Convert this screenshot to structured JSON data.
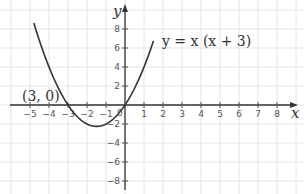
{
  "chart_data": {
    "type": "line",
    "title": "",
    "xlabel": "x",
    "ylabel": "y",
    "xlim": [
      -6.5,
      9
    ],
    "ylim": [
      -9,
      11
    ],
    "x_ticks": [
      -5,
      -4,
      -3,
      -2,
      -1,
      1,
      2,
      3,
      4,
      5,
      6,
      7,
      8
    ],
    "x_tick_labels": [
      "−5",
      "−4",
      "−3",
      "−2",
      "−1",
      "1",
      "2",
      "3",
      "4",
      "5",
      "6",
      "7",
      "8"
    ],
    "y_ticks": [
      8,
      6,
      4,
      2,
      -2,
      -4,
      -6,
      -8
    ],
    "y_tick_labels": [
      "8",
      "6",
      "4",
      "2",
      "−2",
      "−4",
      "−6",
      "−8"
    ],
    "origin_label": "0",
    "grid": true,
    "series": [
      {
        "name": "y = x (x + 3)",
        "function": "x*(x+3)",
        "x_range": [
          -4.8,
          1.5
        ],
        "points": [
          {
            "x": -4.8,
            "y": 8.64
          },
          {
            "x": -4,
            "y": 4
          },
          {
            "x": -3,
            "y": 0
          },
          {
            "x": -2,
            "y": -2
          },
          {
            "x": -1.5,
            "y": -2.25
          },
          {
            "x": -1,
            "y": -2
          },
          {
            "x": 0,
            "y": 0
          },
          {
            "x": 1,
            "y": 4
          },
          {
            "x": 1.5,
            "y": 6.75
          }
        ]
      }
    ],
    "annotations": [
      {
        "text": "(3, 0)",
        "near_point": {
          "x": -3,
          "y": 0
        }
      },
      {
        "text": "y = x (x + 3)",
        "placement": "right of curve, upper"
      }
    ],
    "legend": "none"
  }
}
